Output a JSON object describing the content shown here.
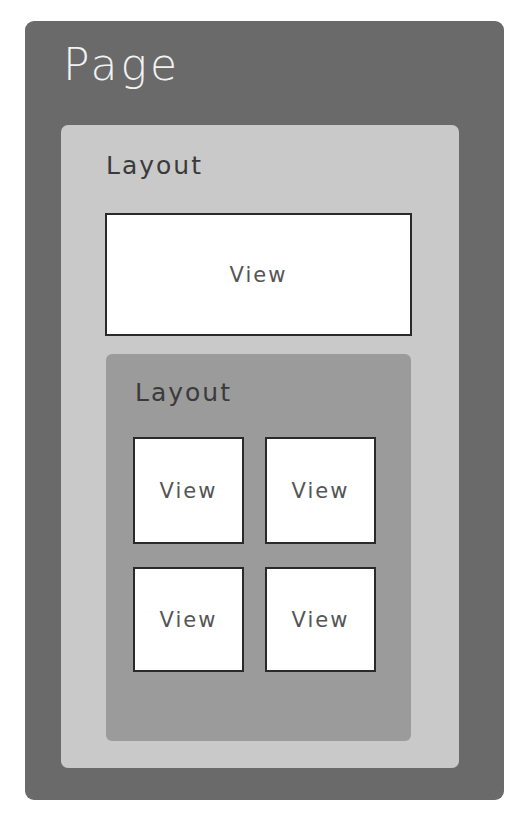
{
  "diagram": {
    "page": {
      "label": "Page",
      "color": "#6a6a6a"
    },
    "outer_layout": {
      "label": "Layout",
      "color": "#c9c9c9"
    },
    "top_view": {
      "label": "View"
    },
    "inner_layout": {
      "label": "Layout",
      "color": "#9b9b9b",
      "views": [
        {
          "label": "View"
        },
        {
          "label": "View"
        },
        {
          "label": "View"
        },
        {
          "label": "View"
        }
      ]
    }
  }
}
